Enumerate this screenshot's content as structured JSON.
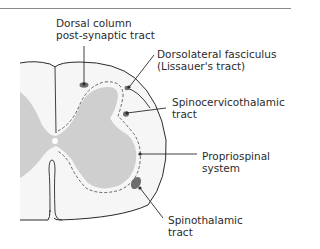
{
  "figure": {
    "colors": {
      "gray_matter": "#cfcfcf",
      "white_matter": "#f6f6f6",
      "outline": "#2b2b2b",
      "tract": "#6e6e6e",
      "dashed_boundary": "#555555"
    },
    "labels": {
      "dorsal_column": {
        "line1": "Dorsal column",
        "line2": "post-synaptic tract"
      },
      "dorsolateral": {
        "line1": "Dorsolateral fasciculus",
        "line2": "(Lissauer's tract)"
      },
      "spinocervicothalamic": {
        "line1": "Spinocervicothalamic",
        "line2": "tract"
      },
      "propriospinal": {
        "line1": "Propriospinal",
        "line2": "system"
      },
      "spinothalamic": {
        "line1": "Spinothalamic",
        "line2": "tract"
      }
    }
  }
}
